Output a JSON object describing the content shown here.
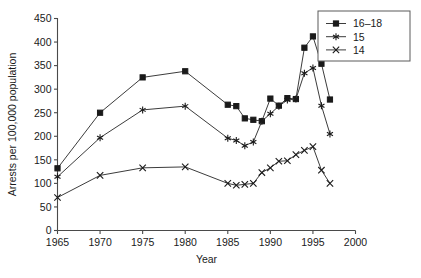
{
  "chart_data": {
    "type": "line",
    "title": "",
    "xlabel": "Year",
    "ylabel": "Arrests per 100,000 population",
    "xlim": [
      1965,
      2000
    ],
    "ylim": [
      0,
      450
    ],
    "xticks": [
      1965,
      1970,
      1975,
      1980,
      1985,
      1990,
      1995,
      2000
    ],
    "yticks": [
      0,
      50,
      100,
      150,
      200,
      250,
      300,
      350,
      400,
      450
    ],
    "xtick_labels": [
      "1965",
      "1970",
      "1975",
      "1980",
      "1985",
      "1990",
      "1995",
      "2000"
    ],
    "ytick_labels": [
      "0",
      "50",
      "100",
      "150",
      "200",
      "250",
      "300",
      "350",
      "400",
      "450"
    ],
    "grid": false,
    "legend_position": "top-right",
    "series": [
      {
        "name": "16-18",
        "label": "16–18",
        "marker": "square",
        "x": [
          1965,
          1970,
          1975,
          1980,
          1985,
          1986,
          1987,
          1988,
          1989,
          1990,
          1991,
          1992,
          1993,
          1994,
          1995,
          1996,
          1997
        ],
        "values": [
          132,
          250,
          325,
          338,
          267,
          264,
          238,
          235,
          232,
          280,
          265,
          281,
          279,
          388,
          412,
          398,
          354
        ]
      },
      {
        "name": "15",
        "label": "15",
        "marker": "star",
        "x": [
          1965,
          1970,
          1975,
          1980,
          1985,
          1986,
          1987,
          1988,
          1989,
          1990,
          1991,
          1992,
          1993,
          1994,
          1995,
          1996,
          1997
        ],
        "values": [
          114,
          197,
          256,
          264,
          196,
          191,
          180,
          188,
          232,
          248,
          264,
          277,
          279,
          334,
          345,
          330,
          300
        ]
      },
      {
        "name": "14",
        "label": "14",
        "marker": "x",
        "x": [
          1965,
          1970,
          1975,
          1980,
          1985,
          1986,
          1987,
          1988,
          1989,
          1990,
          1991,
          1992,
          1993,
          1994,
          1995,
          1996,
          1997
        ],
        "values": [
          70,
          117,
          133,
          135,
          100,
          96,
          98,
          100,
          123,
          133,
          147,
          148,
          161,
          170,
          178,
          161,
          130
        ]
      }
    ],
    "series_tail": [
      {
        "name": "16-18",
        "x": [
          1996,
          1997
        ],
        "values": [
          354,
          278
        ]
      },
      {
        "name": "15",
        "x": [
          1996,
          1997
        ],
        "values": [
          265,
          205
        ]
      },
      {
        "name": "14",
        "x": [
          1996,
          1997
        ],
        "values": [
          128,
          100
        ]
      }
    ]
  },
  "legend": {
    "entries": [
      {
        "label": "16–18",
        "marker": "square"
      },
      {
        "label": "15",
        "marker": "star"
      },
      {
        "label": "14",
        "marker": "x"
      }
    ]
  },
  "axes": {
    "x_title": "Year",
    "y_title": "Arrests per 100,000 population"
  }
}
